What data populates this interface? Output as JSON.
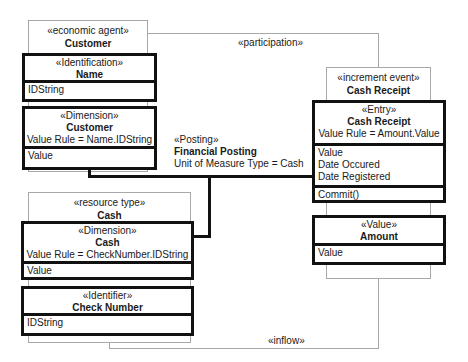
{
  "relations": {
    "participation": "«participation»",
    "inflow": "«inflow»"
  },
  "customer": {
    "stereotype": "«economic agent»",
    "name": "Customer",
    "identification": {
      "stereotype": "«Identification»",
      "name": "Name",
      "attributes": [
        "IDString"
      ]
    },
    "dimension": {
      "stereotype": "«Dimension»",
      "name": "Customer",
      "rule": "Value Rule = Name.IDString",
      "attributes": [
        "Value"
      ]
    }
  },
  "posting": {
    "stereotype": "«Posting»",
    "name": "Financial Posting",
    "rule": "Unit of Measure Type = Cash"
  },
  "cash_receipt": {
    "stereotype": "«increment event»",
    "name": "Cash Receipt",
    "entry": {
      "stereotype": "«Entry»",
      "name": "Cash Receipt",
      "rule": "Value Rule = Amount.Value",
      "attributes": [
        "Value",
        "Date Occured",
        "Date Registered"
      ],
      "operations": [
        "Commit()"
      ]
    },
    "value": {
      "stereotype": "«Value»",
      "name": "Amount",
      "attributes": [
        "Value"
      ]
    }
  },
  "cash": {
    "stereotype": "«resource type»",
    "name": "Cash",
    "dimension": {
      "stereotype": "«Dimension»",
      "name": "Cash",
      "rule": "Value Rule = CheckNumber.IDString",
      "attributes": [
        "Value"
      ]
    },
    "identifier": {
      "stereotype": "«Identifier»",
      "name": "Check Number",
      "attributes": [
        "IDString"
      ]
    }
  }
}
